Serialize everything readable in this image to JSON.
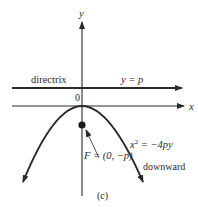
{
  "figure": {
    "caption": "(c)",
    "axes": {
      "x_label": "x",
      "y_label": "y",
      "origin_label": "0"
    },
    "directrix": {
      "label": "directrix",
      "equation": "y = p"
    },
    "focus": {
      "label": "F = (0, −p)"
    },
    "parabola": {
      "equation_base": "x",
      "equation_exp": "2",
      "equation_rest": " = −4py",
      "orientation": "downward"
    },
    "colors": {
      "ink": "#2a2a2a",
      "background": "#ffffff"
    }
  }
}
